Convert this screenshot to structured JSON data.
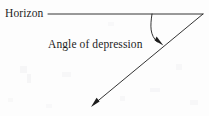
{
  "figure": {
    "width": 209,
    "height": 116,
    "background_color": "#fdfdfd",
    "ink_color": "#1d1d1d"
  },
  "labels": {
    "horizon": "Horizon",
    "angle_of_depression": "Angle of depression"
  },
  "geometry": {
    "vertex": {
      "x": 203,
      "y": 14
    },
    "horizon_line": {
      "name": "horizon-line",
      "x1": 48,
      "y1": 14,
      "x2": 203,
      "y2": 14,
      "stroke_width": 0.9
    },
    "line_of_sight_ray": {
      "name": "line-of-sight-ray",
      "x1": 203,
      "y1": 14,
      "x2": 93,
      "y2": 105,
      "stroke_width": 0.9,
      "arrowhead": "at-lower-left-end"
    },
    "angle_arc": {
      "name": "angle-arc",
      "start": {
        "x": 152,
        "y": 14
      },
      "control": {
        "x": 149,
        "y": 36
      },
      "end": {
        "x": 162,
        "y": 44
      },
      "stroke_width": 0.9,
      "arrowhead": "at-ray-end"
    },
    "arrow_heads": [
      {
        "name": "ray-arrowhead",
        "tip_x": 91,
        "tip_y": 107,
        "angle_deg": 219
      },
      {
        "name": "arc-arrowhead",
        "tip_x": 163,
        "tip_y": 45,
        "angle_deg": 57
      }
    ]
  },
  "icons": {
    "ray_arrow": "arrow-down-left-icon",
    "arc_arrow": "arrow-down-right-icon"
  }
}
